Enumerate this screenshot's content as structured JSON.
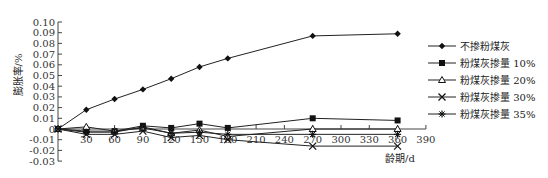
{
  "chart_data": {
    "type": "line",
    "title": "",
    "xlabel": "龄期/d",
    "ylabel": "膨胀率/%",
    "x": [
      0,
      30,
      60,
      90,
      120,
      150,
      180,
      270,
      360
    ],
    "xticks": [
      30,
      60,
      90,
      120,
      150,
      180,
      210,
      240,
      270,
      300,
      330,
      360,
      390
    ],
    "yticks": [
      "0.10",
      "0.09",
      "0.08",
      "0.07",
      "0.06",
      "0.05",
      "0.04",
      "0.03",
      "0.02",
      "0.01",
      "0",
      "-0.01",
      "-0.02",
      "-0.03"
    ],
    "ytick_values": [
      0.1,
      0.09,
      0.08,
      0.07,
      0.06,
      0.05,
      0.04,
      0.03,
      0.02,
      0.01,
      0,
      -0.01,
      -0.02,
      -0.03
    ],
    "xlim": [
      0,
      390
    ],
    "ylim": [
      -0.03,
      0.1
    ],
    "grid": false,
    "legend_position": "right",
    "series": [
      {
        "name": "不掺粉煤灰",
        "marker": "diamond",
        "values": [
          0,
          0.018,
          0.028,
          0.037,
          0.047,
          0.058,
          0.066,
          0.087,
          0.089
        ]
      },
      {
        "name": "粉煤灰掺量 10%",
        "marker": "square",
        "values": [
          0,
          -0.002,
          -0.002,
          0.003,
          0.001,
          0.005,
          0.001,
          0.01,
          0.008
        ]
      },
      {
        "name": "粉煤灰掺量 20%",
        "marker": "triangle",
        "values": [
          0,
          0.002,
          -0.002,
          0.001,
          -0.004,
          -0.001,
          -0.007,
          0.0,
          0.0
        ]
      },
      {
        "name": "粉煤灰掺量 30%",
        "marker": "x",
        "values": [
          0,
          -0.005,
          -0.005,
          -0.002,
          -0.008,
          -0.006,
          -0.01,
          -0.016,
          -0.016
        ]
      },
      {
        "name": "粉煤灰掺量 35%",
        "marker": "asterisk",
        "values": [
          0,
          -0.003,
          -0.003,
          0.002,
          -0.004,
          -0.003,
          -0.005,
          -0.005,
          -0.005
        ]
      }
    ]
  }
}
